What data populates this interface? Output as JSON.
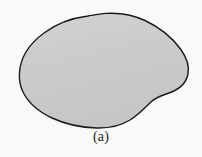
{
  "figure": {
    "caption": "(a)",
    "label": "a",
    "kind": "closed-plane-region",
    "colors": {
      "background": "#f9f9f8",
      "fill": "#cbcbcb",
      "fill_shade_light": "#d2d2d2",
      "outline": "#1a1a1a",
      "caption_text": "#1c1c1c"
    },
    "outline": {
      "stroke_width": 1.4,
      "closed": true
    },
    "geometry": {
      "viewbox": [
        0,
        0,
        202,
        157
      ],
      "bounds": {
        "left": 19,
        "right": 189,
        "top": 13,
        "bottom": 128
      },
      "extreme_points": {
        "leftmost": [
          19,
          72
        ],
        "rightmost": [
          189,
          62
        ],
        "topmost": [
          120,
          13
        ],
        "bottommost": [
          97,
          128
        ]
      },
      "notch": {
        "present": true,
        "side": "lower-right",
        "center": [
          160,
          97
        ],
        "note": "concave inflection between right bulge and bottom sweep"
      },
      "kink": {
        "present": true,
        "location": [
          88,
          16
        ],
        "note": "slight corner on upper-left shoulder"
      },
      "path": "M 19.5 72.5 C 20.5 58.0 29.0 44.0 44.0 33.0 C 58.0 22.5 76.0 17.5 88.0 16.0 C 93.0 15.2 99.0 14.0 106.0 13.4 C 118.0 12.6 132.0 14.5 145.0 20.5 C 160.0 27.5 172.5 38.0 180.5 49.0 C 187.0 58.0 189.5 66.5 188.0 74.0 C 186.0 83.5 178.0 90.0 169.0 93.0 C 162.0 95.3 156.5 97.0 151.5 101.5 C 145.5 107.0 139.0 114.5 130.0 120.0 C 121.0 125.5 110.0 128.3 97.0 128.0 C 82.0 127.6 66.0 124.5 52.0 118.0 C 38.0 111.5 28.0 102.0 23.0 92.0 C 19.8 85.5 19.0 78.8 19.5 72.5 Z"
    }
  }
}
